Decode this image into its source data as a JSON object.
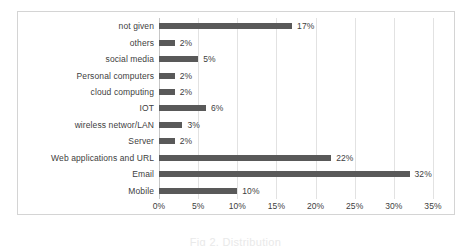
{
  "chart_data": {
    "type": "bar",
    "orientation": "horizontal",
    "title": "",
    "xlabel": "",
    "ylabel": "",
    "xlim": [
      0,
      35
    ],
    "grid": true,
    "legend": false,
    "bar_color": "#595959",
    "gridline_color": "#e2e2e2",
    "frame_color": "#d4d4d4",
    "categories": [
      "not given",
      "others",
      "social media",
      "Personal computers",
      "cloud computing",
      "IOT",
      "wireless networ/LAN",
      "Server",
      "Web applications and URL",
      "Email",
      "Mobile"
    ],
    "values": [
      17,
      2,
      5,
      2,
      2,
      6,
      3,
      2,
      22,
      32,
      10
    ],
    "data_labels": [
      "17%",
      "2%",
      "5%",
      "2%",
      "2%",
      "6%",
      "3%",
      "2%",
      "22%",
      "32%",
      "10%"
    ],
    "xticks": [
      0,
      5,
      10,
      15,
      20,
      25,
      30,
      35
    ],
    "xtick_labels": [
      "0%",
      "5%",
      "10%",
      "15%",
      "20%",
      "25%",
      "30%",
      "35%"
    ]
  },
  "caption": {
    "text": "Fig 2. Distribution"
  }
}
